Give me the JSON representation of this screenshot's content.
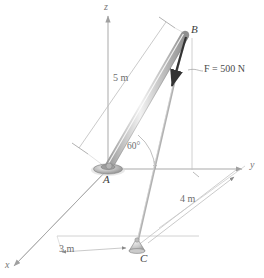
{
  "figure": {
    "type": "engineering-statics-diagram"
  },
  "axes": {
    "x_label": "x",
    "y_label": "y",
    "z_label": "z"
  },
  "points": {
    "A": "A",
    "B": "B",
    "C": "C"
  },
  "dimensions": {
    "rod_length": "5 m",
    "distance_y": "4 m",
    "distance_x": "3 m",
    "angle": "60°"
  },
  "force": {
    "label": "F = 500 N",
    "magnitude": 500,
    "unit": "N",
    "symbol": "F"
  },
  "colors": {
    "rod_dark": "#8c8c8c",
    "rod_light": "#e2e2e2",
    "line": "#b6b6b6",
    "axis": "#a9a9a9",
    "text": "#4a4a4a",
    "arrow": "#333333"
  }
}
